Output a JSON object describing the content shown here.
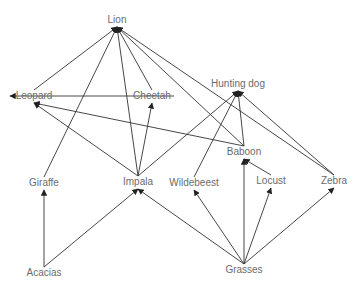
{
  "diagram": {
    "type": "food-web",
    "line_color": "#333333",
    "label_color": "#6b6b6b",
    "nodes": [
      {
        "id": "lion",
        "label": "Lion",
        "x": 117,
        "y": 20
      },
      {
        "id": "leopard",
        "label": "Leopard",
        "x": 34,
        "y": 96
      },
      {
        "id": "cheetah",
        "label": "Cheetah",
        "x": 152,
        "y": 96
      },
      {
        "id": "hunting_dog",
        "label": "Hunting dog",
        "x": 238,
        "y": 84
      },
      {
        "id": "baboon",
        "label": "Baboon",
        "x": 244,
        "y": 152
      },
      {
        "id": "giraffe",
        "label": "Giraffe",
        "x": 44,
        "y": 183
      },
      {
        "id": "impala",
        "label": "Impala",
        "x": 138,
        "y": 182
      },
      {
        "id": "wildebeest",
        "label": "Wildebeest",
        "x": 194,
        "y": 183
      },
      {
        "id": "locust",
        "label": "Locust",
        "x": 271,
        "y": 181
      },
      {
        "id": "zebra",
        "label": "Zebra",
        "x": 334,
        "y": 181
      },
      {
        "id": "acacias",
        "label": "Acacias",
        "x": 44,
        "y": 273
      },
      {
        "id": "grasses",
        "label": "Grasses",
        "x": 244,
        "y": 270
      }
    ],
    "edges": [
      {
        "from": "leopard",
        "to": "lion"
      },
      {
        "from": "giraffe",
        "to": "lion"
      },
      {
        "from": "impala",
        "to": "lion"
      },
      {
        "from": "cheetah",
        "to": "lion"
      },
      {
        "from": "baboon",
        "to": "lion"
      },
      {
        "from": "zebra",
        "to": "lion"
      },
      {
        "from": "cheetah",
        "to": "leopard"
      },
      {
        "from": "impala",
        "to": "leopard"
      },
      {
        "from": "baboon",
        "to": "leopard"
      },
      {
        "from": "impala",
        "to": "cheetah"
      },
      {
        "from": "impala",
        "to": "hunting_dog"
      },
      {
        "from": "wildebeest",
        "to": "hunting_dog"
      },
      {
        "from": "baboon",
        "to": "hunting_dog"
      },
      {
        "from": "zebra",
        "to": "hunting_dog"
      },
      {
        "from": "locust",
        "to": "baboon"
      },
      {
        "from": "grasses",
        "to": "baboon"
      },
      {
        "from": "acacias",
        "to": "giraffe"
      },
      {
        "from": "acacias",
        "to": "impala"
      },
      {
        "from": "grasses",
        "to": "impala"
      },
      {
        "from": "grasses",
        "to": "wildebeest"
      },
      {
        "from": "grasses",
        "to": "locust"
      },
      {
        "from": "grasses",
        "to": "zebra"
      }
    ]
  }
}
